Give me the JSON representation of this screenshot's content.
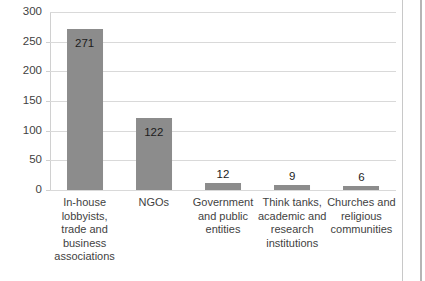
{
  "chart_data": {
    "type": "bar",
    "title": "",
    "subtitle": "",
    "xlabel": "",
    "ylabel": "",
    "ylim": [
      0,
      300
    ],
    "yticks": [
      0,
      50,
      100,
      150,
      200,
      250,
      300
    ],
    "ytick_labels": [
      "0",
      "50",
      "100",
      "150",
      "200",
      "250",
      "300"
    ],
    "grid": true,
    "legend": false,
    "legend_position": "none",
    "bar_color": "#8c8c8c",
    "gridline_color": "#d9d9d9",
    "text_color": "#3f3f3f",
    "categories": [
      "In-house lobbyists, trade and business associations",
      "NGOs",
      "Government and public entities",
      "Think tanks, academic and research institutions",
      "Churches and religious communities"
    ],
    "category_lines": [
      [
        "In-house",
        "lobbyists,",
        "trade and",
        "business",
        "associations"
      ],
      [
        "NGOs"
      ],
      [
        "Government",
        "and public",
        "entities"
      ],
      [
        "Think tanks,",
        "academic and",
        "research",
        "institutions"
      ],
      [
        "Churches and",
        "religious",
        "communities"
      ]
    ],
    "values": [
      271,
      122,
      12,
      9,
      6
    ],
    "value_labels": [
      "271",
      "122",
      "12",
      "9",
      "6"
    ],
    "value_label_placement": [
      "inside",
      "inside",
      "above",
      "above",
      "above"
    ]
  }
}
